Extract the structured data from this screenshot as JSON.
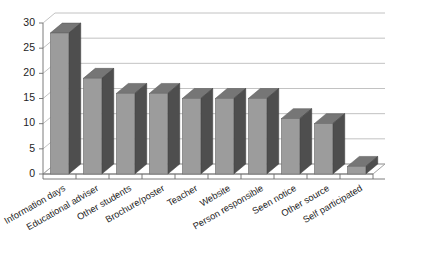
{
  "chart_data": {
    "type": "bar",
    "title": "",
    "subtitle": "",
    "xlabel": "",
    "ylabel": "",
    "ylim": [
      0,
      30
    ],
    "ytick_step": 5,
    "ytick_labels": [
      "0",
      "5",
      "10",
      "15",
      "20",
      "25",
      "30"
    ],
    "grid": true,
    "legend": "none",
    "style": "3d-column",
    "categories": [
      "Information days",
      "Educational adviser",
      "Other students",
      "Brochure/poster",
      "Teacher",
      "Website",
      "Person responsible",
      "Seen notice",
      "Other source",
      "Self participated"
    ],
    "values": [
      28,
      19,
      16,
      16,
      15,
      15,
      15,
      11,
      10,
      1.5
    ],
    "xtick_rotation_deg": -30
  },
  "colors": {
    "bar_front": "#9c9c9c",
    "bar_side": "#4e4e4e",
    "bar_top": "#767676",
    "gridline": "#b3b3b3",
    "axis": "#6d6d6d",
    "text": "#1d1d1d",
    "background": "#ffffff"
  }
}
